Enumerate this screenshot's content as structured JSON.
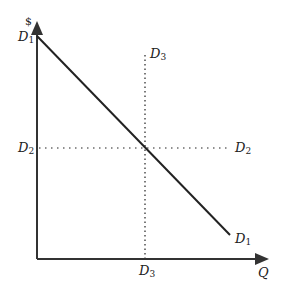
{
  "diagram": {
    "y_axis_label": "$",
    "x_axis_label": "Q",
    "labels": {
      "d1_top": {
        "base": "D",
        "sub": "1"
      },
      "d1_end": {
        "base": "D",
        "sub": "1"
      },
      "d2_left": {
        "base": "D",
        "sub": "2"
      },
      "d2_right": {
        "base": "D",
        "sub": "2"
      },
      "d3_top": {
        "base": "D",
        "sub": "3"
      },
      "d3_bottom": {
        "base": "D",
        "sub": "3"
      }
    },
    "lines": [
      {
        "name": "D1",
        "style": "solid",
        "description": "downward-sloping demand curve"
      },
      {
        "name": "D2",
        "style": "dotted",
        "description": "horizontal (perfectly elastic) line"
      },
      {
        "name": "D3",
        "style": "dotted",
        "description": "vertical (perfectly inelastic) line"
      }
    ],
    "colors": {
      "line": "#222222",
      "axis": "#333333"
    }
  }
}
